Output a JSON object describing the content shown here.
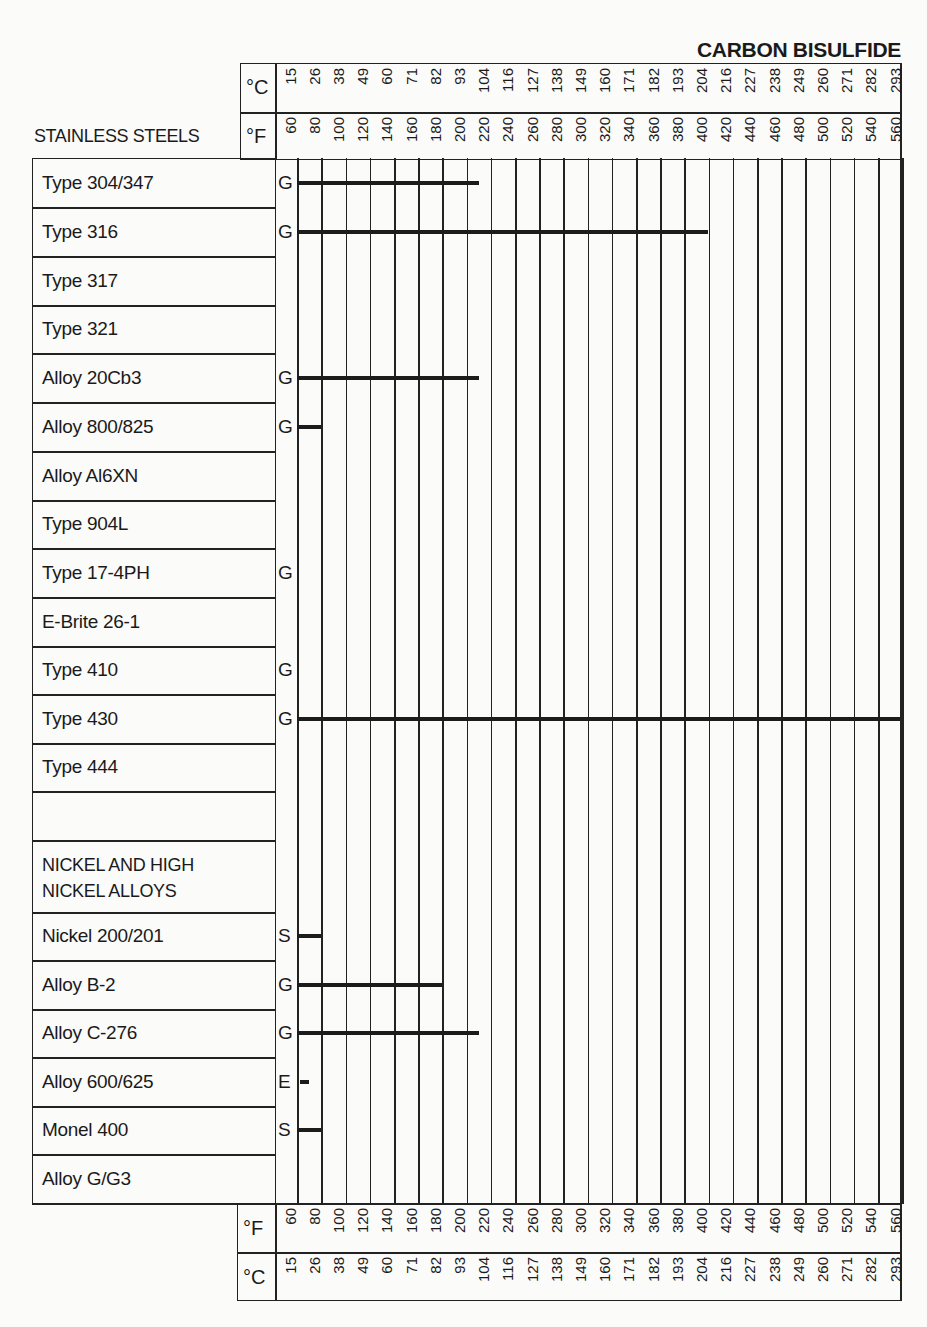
{
  "title": "CARBON BISULFIDE",
  "section_header": "STAINLESS STEELS",
  "units": {
    "celsius": "°C",
    "fahrenheit": "°F"
  },
  "chart_data": {
    "type": "table",
    "title": "CARBON BISULFIDE",
    "x_axis_fahrenheit": [
      60,
      80,
      100,
      120,
      140,
      160,
      180,
      200,
      220,
      240,
      260,
      280,
      300,
      320,
      340,
      360,
      380,
      400,
      420,
      440,
      460,
      480,
      500,
      520,
      540,
      560
    ],
    "x_axis_celsius": [
      15,
      26,
      38,
      49,
      60,
      71,
      82,
      93,
      104,
      116,
      127,
      138,
      149,
      160,
      171,
      182,
      193,
      204,
      216,
      227,
      238,
      249,
      260,
      271,
      282,
      293
    ],
    "groups": [
      "STAINLESS STEELS",
      "NICKEL AND HIGH NICKEL ALLOYS"
    ],
    "rows": [
      {
        "label": "Type 304/347",
        "rating": "G",
        "max_temp_f": 210
      },
      {
        "label": "Type 316",
        "rating": "G",
        "max_temp_f": 400
      },
      {
        "label": "Type 317",
        "rating": "",
        "max_temp_f": null
      },
      {
        "label": "Type 321",
        "rating": "",
        "max_temp_f": null
      },
      {
        "label": "Alloy 20Cb3",
        "rating": "G",
        "max_temp_f": 210
      },
      {
        "label": "Alloy 800/825",
        "rating": "G",
        "max_temp_f": 80
      },
      {
        "label": "Alloy Al6XN",
        "rating": "",
        "max_temp_f": null
      },
      {
        "label": "Type 904L",
        "rating": "",
        "max_temp_f": null
      },
      {
        "label": "Type 17-4PH",
        "rating": "G",
        "max_temp_f": null
      },
      {
        "label": "E-Brite 26-1",
        "rating": "",
        "max_temp_f": null
      },
      {
        "label": "Type 410",
        "rating": "G",
        "max_temp_f": null
      },
      {
        "label": "Type 430",
        "rating": "G",
        "max_temp_f": 570
      },
      {
        "label": "Type 444",
        "rating": "",
        "max_temp_f": null
      },
      {
        "label": "",
        "rating": "",
        "max_temp_f": null
      },
      {
        "label": "NICKEL AND HIGH NICKEL ALLOYS",
        "rating": "",
        "max_temp_f": null,
        "is_group_header": true
      },
      {
        "label": "Nickel 200/201",
        "rating": "S",
        "max_temp_f": 80
      },
      {
        "label": "Alloy B-2",
        "rating": "G",
        "max_temp_f": 180
      },
      {
        "label": "Alloy C-276",
        "rating": "G",
        "max_temp_f": 210
      },
      {
        "label": "Alloy 600/625",
        "rating": "E",
        "max_temp_f": 70
      },
      {
        "label": "Monel 400",
        "rating": "S",
        "max_temp_f": 80
      },
      {
        "label": "Alloy G/G3",
        "rating": "",
        "max_temp_f": null
      }
    ],
    "legend": {
      "E": "Excellent",
      "G": "Good",
      "S": "Satisfactory"
    }
  },
  "rows_display": {
    "r0": {
      "label": "Type 304/347",
      "rating": "G"
    },
    "r1": {
      "label": "Type 316",
      "rating": "G"
    },
    "r2": {
      "label": "Type 317",
      "rating": ""
    },
    "r3": {
      "label": "Type 321",
      "rating": ""
    },
    "r4": {
      "label": "Alloy 20Cb3",
      "rating": "G"
    },
    "r5": {
      "label": "Alloy 800/825",
      "rating": "G"
    },
    "r6": {
      "label": "Alloy Al6XN",
      "rating": ""
    },
    "r7": {
      "label": "Type 904L",
      "rating": ""
    },
    "r8": {
      "label": "Type 17-4PH",
      "rating": "G"
    },
    "r9": {
      "label": "E-Brite 26-1",
      "rating": ""
    },
    "r10": {
      "label": "Type 410",
      "rating": "G"
    },
    "r11": {
      "label": "Type 430",
      "rating": "G"
    },
    "r12": {
      "label": "Type 444",
      "rating": ""
    },
    "r13": {
      "label": "",
      "rating": ""
    },
    "r14": {
      "label": "NICKEL AND HIGH\nNICKEL ALLOYS",
      "rating": ""
    },
    "r15": {
      "label": "Nickel 200/201",
      "rating": "S"
    },
    "r16": {
      "label": "Alloy B-2",
      "rating": "G"
    },
    "r17": {
      "label": "Alloy C-276",
      "rating": "G"
    },
    "r18": {
      "label": "Alloy 600/625",
      "rating": "E"
    },
    "r19": {
      "label": "Monel 400",
      "rating": "S"
    },
    "r20": {
      "label": "Alloy G/G3",
      "rating": ""
    }
  }
}
